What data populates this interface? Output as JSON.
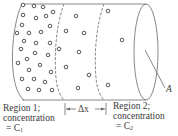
{
  "figure": {
    "type": "diffusion-cylinder",
    "stroke_color": "#6a6a6a",
    "particle_color": "#444444"
  },
  "labels": {
    "region1": {
      "line1": "Region 1;",
      "line2": "concentration",
      "line3_prefix": "= C",
      "line3_sub": "1"
    },
    "region2": {
      "line1": "Region 2;",
      "line2": "concentration",
      "line3_prefix": "= C",
      "line3_sub": "2"
    },
    "delta": "Δx",
    "area": "A"
  },
  "particles": {
    "region1": [
      [
        23,
        5
      ],
      [
        34,
        6
      ],
      [
        43,
        7
      ],
      [
        53,
        12
      ],
      [
        23,
        15
      ],
      [
        36,
        18
      ],
      [
        46,
        16
      ],
      [
        22,
        25
      ],
      [
        50,
        26
      ],
      [
        17,
        33
      ],
      [
        29,
        33
      ],
      [
        41,
        32
      ],
      [
        24,
        41
      ],
      [
        36,
        43
      ],
      [
        50,
        43
      ],
      [
        21,
        49
      ],
      [
        35,
        53
      ],
      [
        48,
        55
      ],
      [
        27,
        59
      ],
      [
        18,
        63
      ],
      [
        40,
        65
      ],
      [
        29,
        70
      ],
      [
        51,
        72
      ],
      [
        22,
        79
      ],
      [
        34,
        79
      ],
      [
        45,
        82
      ],
      [
        28,
        89
      ],
      [
        39,
        90
      ],
      [
        52,
        90
      ]
    ],
    "region_mid": [
      [
        76,
        16
      ],
      [
        66,
        31
      ],
      [
        84,
        33
      ],
      [
        59,
        49
      ],
      [
        79,
        52
      ],
      [
        66,
        67
      ],
      [
        89,
        75
      ],
      [
        78,
        88
      ]
    ],
    "region2": [
      [
        108,
        11
      ],
      [
        122,
        40
      ],
      [
        108,
        85
      ]
    ]
  }
}
